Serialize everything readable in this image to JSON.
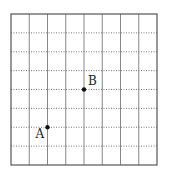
{
  "grid": {
    "columns": 8,
    "rows": 8
  },
  "points": [
    {
      "label": "A",
      "x": 2,
      "y": 2,
      "label_side": "bottom-left"
    },
    {
      "label": "B",
      "x": 4,
      "y": 4,
      "label_side": "top-right"
    }
  ]
}
